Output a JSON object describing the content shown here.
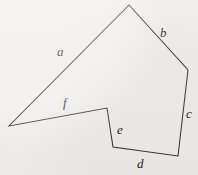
{
  "figure": {
    "kind": "labeled-polygon-diagram",
    "background_color": "#efedeb",
    "stroke_color": "#33302e",
    "label_color": "#1c1a19",
    "canvas": {
      "width": 198,
      "height": 175
    },
    "vertices": [
      {
        "id": "apex",
        "x": 129,
        "y": 5
      },
      {
        "id": "right",
        "x": 188,
        "y": 70
      },
      {
        "id": "bottom-right",
        "x": 178,
        "y": 156
      },
      {
        "id": "bottom-left",
        "x": 113,
        "y": 147
      },
      {
        "id": "notch-top",
        "x": 107,
        "y": 108
      },
      {
        "id": "left",
        "x": 9,
        "y": 126
      }
    ],
    "path": "M 129 5 L 188 70 L 178 156 L 113 147 L 107 108 L 9 126 Z",
    "edges": [
      {
        "id": "edge-a",
        "label": "a",
        "from": "left",
        "to": "apex",
        "label_x": 57,
        "label_y": 45
      },
      {
        "id": "edge-b",
        "label": "b",
        "from": "apex",
        "to": "right",
        "label_x": 160,
        "label_y": 26
      },
      {
        "id": "edge-c",
        "label": "c",
        "from": "right",
        "to": "bottom-right",
        "label_x": 186,
        "label_y": 107
      },
      {
        "id": "edge-d",
        "label": "d",
        "from": "bottom-right",
        "to": "bottom-left",
        "label_x": 137,
        "label_y": 157
      },
      {
        "id": "edge-e",
        "label": "e",
        "from": "bottom-left",
        "to": "notch-top",
        "label_x": 117,
        "label_y": 123
      },
      {
        "id": "edge-f",
        "label": "f",
        "from": "notch-top",
        "to": "left",
        "label_x": 63,
        "label_y": 96
      }
    ]
  }
}
